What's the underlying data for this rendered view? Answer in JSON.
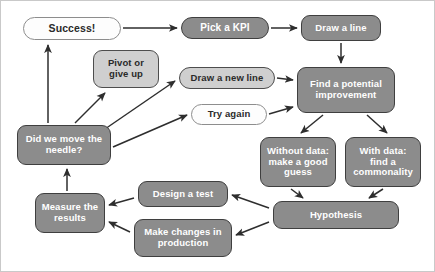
{
  "diagram": {
    "background": "#ffffff",
    "frame_color": "#c9c9c9",
    "palette": {
      "dark_box_fill": "#8c8c8c",
      "dark_box_text": "#ffffff",
      "light_box_fill": "#cfcfcf",
      "light_box_text": "#2a2a2a",
      "white_box_fill": "#fdfdfd",
      "border": "#4a4a4a",
      "arrow": "#2e2e2e"
    },
    "nodes": [
      {
        "id": "success",
        "label": "Success!",
        "style": "white-pill",
        "x": 22,
        "y": 16,
        "w": 98,
        "h": 23,
        "font": 10.5
      },
      {
        "id": "pick_kpi",
        "label": "Pick a KPI",
        "style": "dark-pill",
        "x": 180,
        "y": 16,
        "w": 88,
        "h": 22,
        "font": 10
      },
      {
        "id": "draw_line",
        "label": "Draw a line",
        "style": "dark",
        "x": 300,
        "y": 14,
        "w": 80,
        "h": 26,
        "font": 9.5
      },
      {
        "id": "pivot",
        "label": "Pivot or\ngive up",
        "style": "light",
        "x": 92,
        "y": 49,
        "w": 66,
        "h": 38,
        "font": 9.5
      },
      {
        "id": "draw_new",
        "label": "Draw a new line",
        "style": "light-pill",
        "x": 178,
        "y": 66,
        "w": 96,
        "h": 22,
        "font": 9.5
      },
      {
        "id": "try_again",
        "label": "Try again",
        "style": "white-pill",
        "x": 190,
        "y": 103,
        "w": 76,
        "h": 21,
        "font": 9.5
      },
      {
        "id": "find_improve",
        "label": "Find a potential\nimprovement",
        "style": "dark",
        "x": 296,
        "y": 66,
        "w": 98,
        "h": 46,
        "font": 9.5
      },
      {
        "id": "did_we_move",
        "label": "Did we move the\nneedle?",
        "style": "dark",
        "x": 16,
        "y": 124,
        "w": 94,
        "h": 40,
        "font": 9.5
      },
      {
        "id": "without_data",
        "label": "Without data:\nmake a good\nguess",
        "style": "dark",
        "x": 259,
        "y": 136,
        "w": 76,
        "h": 50,
        "font": 9.5
      },
      {
        "id": "with_data",
        "label": "With data:\nfind a\ncommonality",
        "style": "dark",
        "x": 344,
        "y": 136,
        "w": 76,
        "h": 50,
        "font": 9.5
      },
      {
        "id": "hypothesis",
        "label": "Hypothesis",
        "style": "dark",
        "x": 272,
        "y": 200,
        "w": 126,
        "h": 28,
        "font": 9.5
      },
      {
        "id": "design_test",
        "label": "Design a test",
        "style": "dark",
        "x": 137,
        "y": 180,
        "w": 90,
        "h": 26,
        "font": 9.5
      },
      {
        "id": "make_changes",
        "label": "Make changes in\nproduction",
        "style": "dark",
        "x": 133,
        "y": 218,
        "w": 98,
        "h": 38,
        "font": 9.5
      },
      {
        "id": "measure",
        "label": "Measure the\nresults",
        "style": "dark",
        "x": 34,
        "y": 192,
        "w": 70,
        "h": 40,
        "font": 9.5
      }
    ],
    "edges": [
      {
        "from": "success",
        "to": "pick_kpi",
        "kind": "straight-right"
      },
      {
        "from": "pick_kpi",
        "to": "draw_line",
        "kind": "straight-right"
      },
      {
        "from": "draw_line",
        "to": "find_improve",
        "kind": "straight-down"
      },
      {
        "from": "draw_new",
        "to": "find_improve",
        "kind": "straight-right"
      },
      {
        "from": "try_again",
        "to": "find_improve",
        "kind": "straight-right"
      },
      {
        "from": "find_improve",
        "to": "without_data",
        "kind": "diagonal-down-left"
      },
      {
        "from": "find_improve",
        "to": "with_data",
        "kind": "diagonal-down-right"
      },
      {
        "from": "without_data",
        "to": "hypothesis",
        "kind": "diagonal-down"
      },
      {
        "from": "with_data",
        "to": "hypothesis",
        "kind": "diagonal-down"
      },
      {
        "from": "hypothesis",
        "to": "design_test",
        "kind": "diagonal-up-left"
      },
      {
        "from": "hypothesis",
        "to": "make_changes",
        "kind": "diagonal-left"
      },
      {
        "from": "design_test",
        "to": "measure",
        "kind": "straight-left"
      },
      {
        "from": "make_changes",
        "to": "measure",
        "kind": "diagonal-up-left"
      },
      {
        "from": "measure",
        "to": "did_we_move",
        "kind": "straight-up"
      },
      {
        "from": "did_we_move",
        "to": "success",
        "kind": "straight-up"
      },
      {
        "from": "did_we_move",
        "to": "pivot",
        "kind": "diagonal-up-right"
      },
      {
        "from": "did_we_move",
        "to": "draw_new",
        "kind": "diagonal-up-right"
      },
      {
        "from": "did_we_move",
        "to": "try_again",
        "kind": "diagonal-up-right"
      }
    ]
  }
}
